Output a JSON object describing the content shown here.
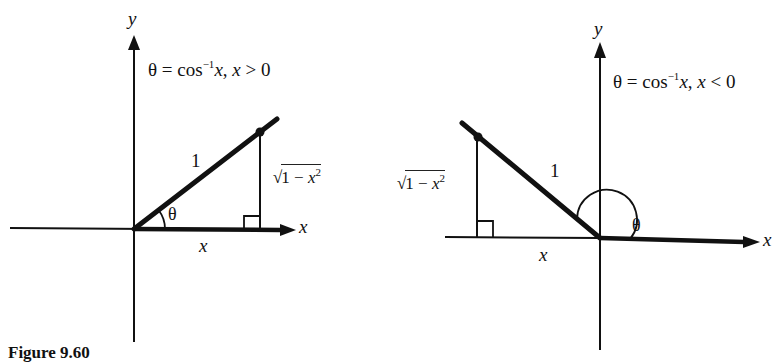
{
  "figure": {
    "caption": "Figure 9.60",
    "colors": {
      "ink": "#111111",
      "background": "#ffffff"
    }
  },
  "left_panel": {
    "axis_y_label": "y",
    "axis_x_label": "x",
    "equation": {
      "theta": "θ",
      "equals": " = cos",
      "superscript": "−1",
      "arg": "x",
      "sep": ", ",
      "cond_var": "x",
      "cond": " > 0"
    },
    "hypotenuse_label": "1",
    "angle_label": "θ",
    "adjacent_label": "x",
    "opposite_label": {
      "sqrt": "√",
      "body": "1 − ",
      "var": "x",
      "exp": "2"
    }
  },
  "right_panel": {
    "axis_y_label": "y",
    "axis_x_label": "x",
    "equation": {
      "theta": "θ",
      "equals": " = cos",
      "superscript": "−1",
      "arg": "x",
      "sep": ", ",
      "cond_var": "x",
      "cond": " < 0"
    },
    "hypotenuse_label": "1",
    "angle_label": "θ",
    "adjacent_label": "x",
    "opposite_label": {
      "sqrt": "√",
      "body": "1 − ",
      "var": "x",
      "exp": "2"
    }
  }
}
